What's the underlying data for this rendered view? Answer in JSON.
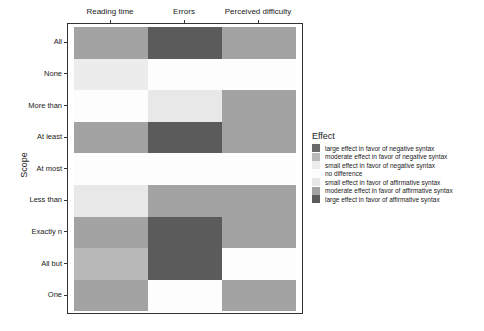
{
  "chart_data": {
    "type": "heatmap",
    "title": "",
    "xlabel": "",
    "ylabel": "Scope",
    "x_position": "top",
    "categories_x": [
      "Reading time",
      "Errors",
      "Perceived difficulty"
    ],
    "categories_y": [
      "All",
      "None",
      "More than",
      "At least",
      "At most",
      "Less than",
      "Exactly n",
      "All but",
      "One"
    ],
    "legend": {
      "title": "Effect",
      "position": "right",
      "entries": [
        {
          "key": "large_neg",
          "label": "large effect in favor of negative syntax",
          "color": "#6a6a6a"
        },
        {
          "key": "moderate_neg",
          "label": "moderate effect in favor of negative syntax",
          "color": "#b9b9b9"
        },
        {
          "key": "small_neg",
          "label": "small effect in favor of negative syntax",
          "color": "#ececec"
        },
        {
          "key": "none",
          "label": "no difference",
          "color": "#fdfdfd"
        },
        {
          "key": "small_aff",
          "label": "small effect in favor of affirmative syntax",
          "color": "#e8e8e8"
        },
        {
          "key": "moderate_aff",
          "label": "moderate effect in favor of affirmative syntax",
          "color": "#a3a3a3"
        },
        {
          "key": "large_aff",
          "label": "large effect in favor of affirmative syntax",
          "color": "#5b5b5b"
        }
      ]
    },
    "cells": [
      [
        "moderate_aff",
        "large_aff",
        "moderate_aff"
      ],
      [
        "small_neg",
        "none",
        "none"
      ],
      [
        "none",
        "small_aff",
        "moderate_aff"
      ],
      [
        "moderate_aff",
        "large_aff",
        "moderate_aff"
      ],
      [
        "none",
        "none",
        "none"
      ],
      [
        "small_aff",
        "moderate_aff",
        "moderate_aff"
      ],
      [
        "moderate_aff",
        "large_aff",
        "moderate_aff"
      ],
      [
        "moderate_neg",
        "large_aff",
        "none"
      ],
      [
        "moderate_aff",
        "none",
        "moderate_aff"
      ]
    ],
    "grid": false
  }
}
